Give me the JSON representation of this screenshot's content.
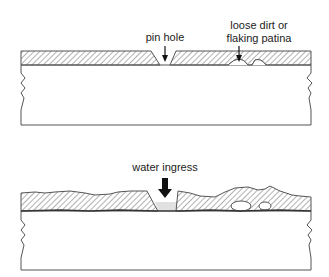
{
  "figure": {
    "top_panel": {
      "labels": {
        "pin_hole": "pin hole",
        "loose_dirt_line1": "loose dirt or",
        "loose_dirt_line2": "flaking patina"
      }
    },
    "bottom_panel": {
      "labels": {
        "water_ingress": "water ingress"
      }
    },
    "colors": {
      "line": "#555555",
      "hatch": "#777777",
      "arrow": "#111111",
      "background": "#ffffff"
    }
  }
}
